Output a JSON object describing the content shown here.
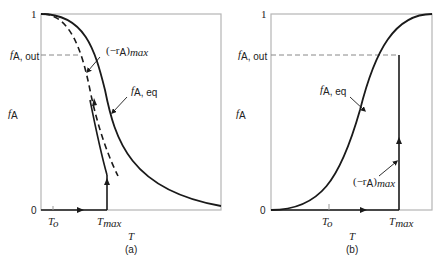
{
  "panels": [
    {
      "id": "a",
      "caption": "(a)",
      "y_axis_label": "f_A",
      "x_axis_label": "T",
      "y_ticks": {
        "top": "1",
        "bottom": "0",
        "f_out": "f_A, out"
      },
      "x_ticks": [
        "T_o",
        "T_max"
      ],
      "annotations": [
        "(-r_A)_max",
        "f_A, eq"
      ]
    },
    {
      "id": "b",
      "caption": "(b)",
      "y_axis_label": "f_A",
      "x_axis_label": "T",
      "y_ticks": {
        "top": "1",
        "bottom": "0",
        "f_out": "f_A, out"
      },
      "x_ticks": [
        "T_o",
        "T_max"
      ],
      "annotations": [
        "f_A, eq",
        "(-r_A)_max"
      ]
    }
  ],
  "text": {
    "one": "1",
    "zero": "0",
    "f": "f",
    "A": "A",
    "Aout": "A, out",
    "Aeq": "A, eq",
    "T": "T",
    "To_T": "T",
    "To_o": "o",
    "Tmax_T": "T",
    "Tmax_sub": "max",
    "r_open": "(−r",
    "r_close": ")",
    "r_sub": "max",
    "cap_a": "(a)",
    "cap_b": "(b)"
  },
  "colors": {
    "curve": "#1a1a1a",
    "axis": "#b0b0b0",
    "dash": "#888888"
  }
}
